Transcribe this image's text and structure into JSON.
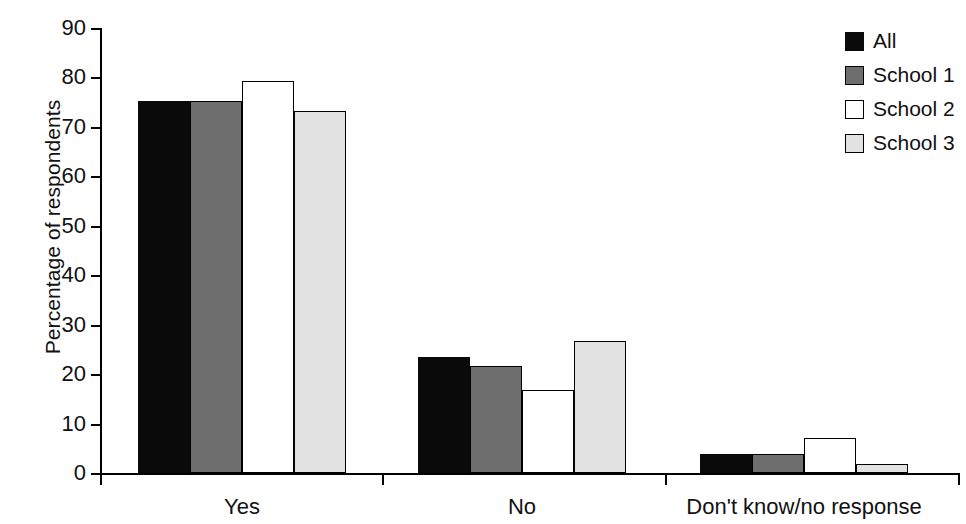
{
  "chart_data": {
    "type": "bar",
    "title": "",
    "xlabel": "",
    "ylabel": "Percentage of respondents",
    "ylim": [
      0,
      90
    ],
    "yticks": [
      0,
      10,
      20,
      30,
      40,
      50,
      60,
      70,
      80,
      90
    ],
    "grid": false,
    "legend_position": "top-right",
    "categories": [
      "Yes",
      "No",
      "Don't know/no response"
    ],
    "series": [
      {
        "name": "All",
        "color": "#0a0a0a",
        "values": [
          75.2,
          23.4,
          3.9
        ]
      },
      {
        "name": "School 1",
        "color": "#6e6e6e",
        "values": [
          75.2,
          21.6,
          3.9
        ]
      },
      {
        "name": "School 2",
        "color": "#ffffff",
        "values": [
          79.2,
          16.7,
          7.0
        ]
      },
      {
        "name": "School 3",
        "color": "#e2e2e2",
        "values": [
          73.2,
          26.6,
          1.8
        ]
      }
    ]
  },
  "axis": {
    "y_title": "Percentage of respondents",
    "y_tick_labels": [
      "0",
      "10",
      "20",
      "30",
      "40",
      "50",
      "60",
      "70",
      "80",
      "90"
    ],
    "x_group_labels": [
      "Yes",
      "No",
      "Don't know/no response"
    ]
  },
  "legend": {
    "items": [
      {
        "label": "All",
        "swatch": "black-square-icon"
      },
      {
        "label": "School 1",
        "swatch": "dark-gray-square-icon"
      },
      {
        "label": "School 2",
        "swatch": "white-square-icon"
      },
      {
        "label": "School 3",
        "swatch": "light-gray-square-icon"
      }
    ]
  }
}
